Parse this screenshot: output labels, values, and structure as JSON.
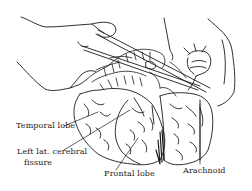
{
  "figure": {
    "labels": {
      "temporal_lobe": "Temporal lobe",
      "left_lat_cerebral_line1": "Left lat. cerebral",
      "left_lat_cerebral_line2": "fissure",
      "frontal_lobe": "Frontal lobe",
      "arachnoid": "Arachnoid"
    },
    "colors": {
      "ink": "#1a1a1a",
      "background": "#ffffff"
    }
  }
}
